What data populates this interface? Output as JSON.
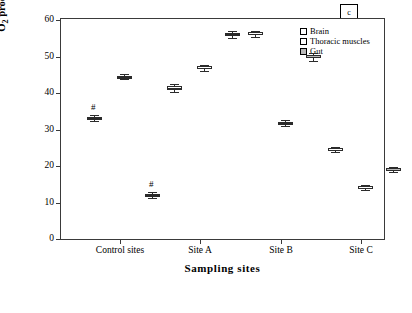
{
  "chart_data": {
    "type": "box",
    "title": "",
    "xlabel": "Sampling sites",
    "ylabel": "O2 production (OD/ mg protein/ min)",
    "ylim": [
      0,
      60
    ],
    "yticks": [
      0,
      10,
      20,
      30,
      40,
      50,
      60
    ],
    "categories": [
      "Control sites",
      "Site A",
      "Site B",
      "Site C"
    ],
    "legend": {
      "position": "top-right",
      "entries": [
        "Brain",
        "Thoracic muscles",
        "Gut"
      ],
      "box_label": "c"
    },
    "series": [
      {
        "name": "Brain",
        "values": [
          33.2,
          41.5,
          56.4,
          24.6
        ],
        "boxes": [
          {
            "category": "Control sites",
            "min": 32.4,
            "q1": 32.9,
            "median": 33.2,
            "q3": 33.6,
            "max": 34.0,
            "annotation": "#"
          },
          {
            "category": "Site A",
            "min": 40.3,
            "q1": 41.0,
            "median": 41.5,
            "q3": 42.0,
            "max": 42.6,
            "annotation": ""
          },
          {
            "category": "Site B",
            "min": 55.6,
            "q1": 56.1,
            "median": 56.4,
            "q3": 56.8,
            "max": 57.2,
            "annotation": ""
          },
          {
            "category": "Site C",
            "min": 23.9,
            "q1": 24.3,
            "median": 24.6,
            "q3": 25.0,
            "max": 25.4,
            "annotation": ""
          }
        ]
      },
      {
        "name": "Thoracic muscles",
        "values": [
          44.6,
          47.0,
          31.8,
          14.2
        ],
        "boxes": [
          {
            "category": "Control sites",
            "min": 43.9,
            "q1": 44.3,
            "median": 44.6,
            "q3": 44.9,
            "max": 45.3,
            "annotation": ""
          },
          {
            "category": "Site A",
            "min": 46.2,
            "q1": 46.7,
            "median": 47.0,
            "q3": 47.4,
            "max": 47.9,
            "annotation": ""
          },
          {
            "category": "Site B",
            "min": 31.0,
            "q1": 31.5,
            "median": 31.8,
            "q3": 32.2,
            "max": 32.7,
            "annotation": ""
          },
          {
            "category": "Site C",
            "min": 13.5,
            "q1": 13.9,
            "median": 14.2,
            "q3": 14.6,
            "max": 15.0,
            "annotation": ""
          }
        ]
      },
      {
        "name": "Gut",
        "values": [
          12.2,
          56.2,
          50.0,
          19.1
        ],
        "boxes": [
          {
            "category": "Control sites",
            "min": 11.5,
            "q1": 11.9,
            "median": 12.2,
            "q3": 12.5,
            "max": 12.9,
            "annotation": "#"
          },
          {
            "category": "Site A",
            "min": 55.3,
            "q1": 55.9,
            "median": 56.2,
            "q3": 56.6,
            "max": 57.0,
            "annotation": ""
          },
          {
            "category": "Site B",
            "min": 48.9,
            "q1": 49.6,
            "median": 50.0,
            "q3": 50.5,
            "max": 51.2,
            "annotation": ""
          },
          {
            "category": "Site C",
            "min": 18.4,
            "q1": 18.8,
            "median": 19.1,
            "q3": 19.5,
            "max": 19.9,
            "annotation": ""
          }
        ]
      }
    ]
  },
  "axis": {
    "y_tick_labels": [
      "0",
      "10",
      "20",
      "30",
      "40",
      "50",
      "60"
    ],
    "x_tick_labels": [
      "Control sites",
      "Site A",
      "Site B",
      "Site C"
    ],
    "y_title_main": "O",
    "y_title_sub": "2",
    "y_title_rest": " production (OD/ mg protein/ min)",
    "x_title": "Sampling sites"
  },
  "legend": {
    "brain": "Brain",
    "thoracic": "Thoracic muscles",
    "gut": "Gut",
    "panel_label": "c"
  }
}
